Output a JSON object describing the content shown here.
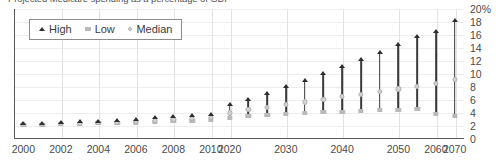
{
  "chart_data": {
    "type": "bar",
    "title": "Projected Medicare spending as a percentage of GDP",
    "xlabel": "",
    "ylabel": "",
    "ylim": [
      0,
      20
    ],
    "y_ticks": [
      "0",
      "2",
      "4",
      "6",
      "8",
      "10",
      "12",
      "14",
      "16",
      "18",
      "20%"
    ],
    "y_tick_values": [
      0,
      2,
      4,
      6,
      8,
      10,
      12,
      14,
      16,
      18,
      20
    ],
    "grid": true,
    "legend_position": "top-left",
    "x_tick_labels": [
      "2000",
      "2002",
      "2004",
      "2006",
      "2008",
      "2010",
      "2020",
      "2030",
      "2040",
      "2050",
      "2060",
      "2070"
    ],
    "x_tick_indices": [
      0,
      2,
      4,
      6,
      8,
      10,
      11,
      14,
      17,
      20,
      22,
      23
    ],
    "categories": [
      "2000",
      "2001",
      "2002",
      "2003",
      "2004",
      "2005",
      "2006",
      "2007",
      "2008",
      "2009",
      "2010",
      "2020",
      "2025",
      "2030",
      "2035",
      "2040",
      "2045",
      "2050",
      "2055",
      "2060",
      "2065",
      "2070",
      "2075",
      "2080"
    ],
    "series": [
      {
        "name": "High",
        "values": [
          2.2,
          2.3,
          2.4,
          2.5,
          2.6,
          2.7,
          2.9,
          3.1,
          3.3,
          3.5,
          3.7,
          5.1,
          6.0,
          6.9,
          7.9,
          8.9,
          9.9,
          11.0,
          12.1,
          13.2,
          14.4,
          15.6,
          16.4,
          18.1
        ]
      },
      {
        "name": "Low",
        "values": [
          2.2,
          2.2,
          2.3,
          2.3,
          2.4,
          2.4,
          2.5,
          2.6,
          2.7,
          2.8,
          2.9,
          3.3,
          3.5,
          3.7,
          3.9,
          4.0,
          4.1,
          4.2,
          4.3,
          4.4,
          4.5,
          4.6,
          3.9,
          3.6
        ]
      },
      {
        "name": "Median",
        "values": [
          2.2,
          2.25,
          2.35,
          2.4,
          2.5,
          2.55,
          2.7,
          2.85,
          3.0,
          3.15,
          3.3,
          4.0,
          4.5,
          4.9,
          5.3,
          5.7,
          6.1,
          6.5,
          6.9,
          7.3,
          7.7,
          8.1,
          8.6,
          9.1
        ]
      }
    ]
  },
  "legend": {
    "items": [
      {
        "label": "High",
        "marker": "triangle-up-icon"
      },
      {
        "label": "Low",
        "marker": "square-icon"
      },
      {
        "label": "Median",
        "marker": "circle-icon"
      }
    ]
  }
}
